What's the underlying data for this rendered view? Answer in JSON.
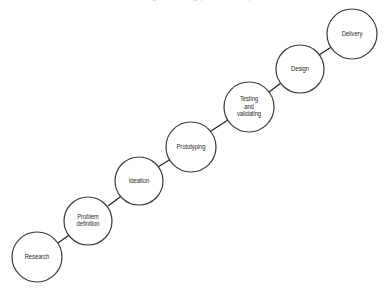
{
  "diagram": {
    "title_clipped": "Design thinking process steps",
    "background_color": "#ffffff",
    "node_fill": "#ffffff",
    "node_stroke": "#3a3a3a",
    "arrow_color": "#1a1a1a",
    "text_color": "#2b2b2b",
    "type": "process-flow-staircase",
    "direction": "ascending-left-to-right",
    "nodes": [
      {
        "id": "research",
        "label": "Research",
        "cx": 37,
        "cy": 257,
        "r": 25
      },
      {
        "id": "problem",
        "label": "Problem\ndefinition",
        "cx": 88,
        "cy": 221,
        "r": 24
      },
      {
        "id": "ideation",
        "label": "Ideation",
        "cx": 139,
        "cy": 181,
        "r": 24
      },
      {
        "id": "prototype",
        "label": "Prototyping",
        "cx": 191,
        "cy": 147,
        "r": 25
      },
      {
        "id": "testing",
        "label": "Testing\nand\nvalidating",
        "cx": 249,
        "cy": 107,
        "r": 25
      },
      {
        "id": "design",
        "label": "Design",
        "cx": 300,
        "cy": 69,
        "r": 24
      },
      {
        "id": "delivery",
        "label": "Delivery",
        "cx": 352,
        "cy": 34,
        "r": 25
      }
    ],
    "edges": [
      {
        "from": "research",
        "to": "problem",
        "x1": 58,
        "y1": 243,
        "x2": 72,
        "y2": 233
      },
      {
        "from": "problem",
        "to": "ideation",
        "x1": 108,
        "y1": 206,
        "x2": 124,
        "y2": 194
      },
      {
        "from": "ideation",
        "to": "prototype",
        "x1": 158,
        "y1": 167,
        "x2": 174,
        "y2": 157
      },
      {
        "from": "prototype",
        "to": "testing",
        "x1": 211,
        "y1": 131,
        "x2": 231,
        "y2": 118
      },
      {
        "from": "testing",
        "to": "design",
        "x1": 269,
        "y1": 92,
        "x2": 285,
        "y2": 80
      },
      {
        "from": "design",
        "to": "delivery",
        "x1": 319,
        "y1": 55,
        "x2": 336,
        "y2": 44
      }
    ]
  }
}
